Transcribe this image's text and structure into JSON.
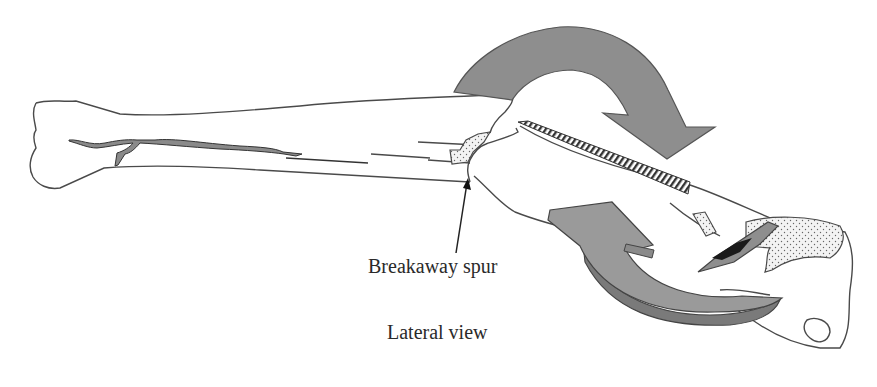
{
  "figure": {
    "labels": {
      "breakaway_spur": "Breakaway spur",
      "view": "Lateral view"
    },
    "colors": {
      "outline": "#4a4a4a",
      "arrow_fill": "#8e8e8e",
      "arrow_edge": "#555555",
      "fracture_fill": "#8a8a8a",
      "stipple_bg": "#f2f2f2",
      "dark_fragment": "#1a1a1a",
      "background": "#ffffff"
    },
    "arrows": [
      {
        "name": "rotation-arrow-top",
        "direction": "clockwise"
      },
      {
        "name": "rotation-arrow-bottom",
        "direction": "counter-clockwise"
      }
    ]
  }
}
